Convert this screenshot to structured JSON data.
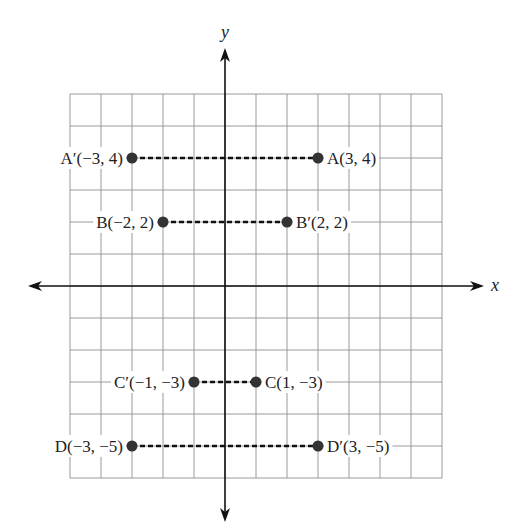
{
  "chart_data": {
    "type": "scatter",
    "title": "",
    "xlabel": "x",
    "ylabel": "y",
    "xlim": [
      -5,
      7
    ],
    "ylim": [
      -6,
      6
    ],
    "grid": true,
    "legend": null,
    "points": [
      {
        "name": "A",
        "label": "A(3, 4)",
        "x": 3,
        "y": 4,
        "label_side": "right"
      },
      {
        "name": "A'",
        "label": "A′(−3, 4)",
        "x": -3,
        "y": 4,
        "label_side": "left"
      },
      {
        "name": "B",
        "label": "B(−2, 2)",
        "x": -2,
        "y": 2,
        "label_side": "left"
      },
      {
        "name": "B'",
        "label": "B′(2, 2)",
        "x": 2,
        "y": 2,
        "label_side": "right"
      },
      {
        "name": "C",
        "label": "C(1, −3)",
        "x": 1,
        "y": -3,
        "label_side": "right"
      },
      {
        "name": "C'",
        "label": "C′(−1, −3)",
        "x": -1,
        "y": -3,
        "label_side": "left"
      },
      {
        "name": "D",
        "label": "D(−3, −5)",
        "x": -3,
        "y": -5,
        "label_side": "left"
      },
      {
        "name": "D'",
        "label": "D′(3, −5)",
        "x": 3,
        "y": -5,
        "label_side": "right"
      }
    ],
    "segments": [
      {
        "from": "A'",
        "to": "A",
        "style": "dashed"
      },
      {
        "from": "B",
        "to": "B'",
        "style": "dashed"
      },
      {
        "from": "C'",
        "to": "C",
        "style": "dashed"
      },
      {
        "from": "D",
        "to": "D'",
        "style": "dashed"
      }
    ]
  },
  "axes": {
    "x_label": "x",
    "y_label": "y"
  }
}
